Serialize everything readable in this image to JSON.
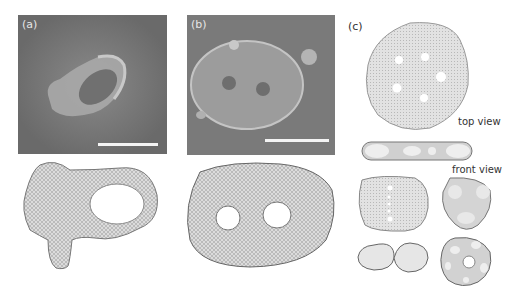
{
  "figure": {
    "panels": [
      {
        "id": "a",
        "label": "(a)",
        "type": "SEM micrograph with one-hole toroidal vesicle and simulated mesh below"
      },
      {
        "id": "b",
        "label": "(b)",
        "type": "SEM micrograph with two-hole vesicle and simulated mesh below"
      },
      {
        "id": "c",
        "label": "(c)",
        "type": "Simulated multi-hole vesicle shapes"
      }
    ],
    "annotations": {
      "top_view": "top view",
      "front_view": "front view"
    },
    "colors": {
      "sem_background": "#6e6e6e",
      "scale_bar": "#f4f4f4",
      "mesh_fill": "#d8d8d8",
      "mesh_edge": "#777777"
    }
  }
}
